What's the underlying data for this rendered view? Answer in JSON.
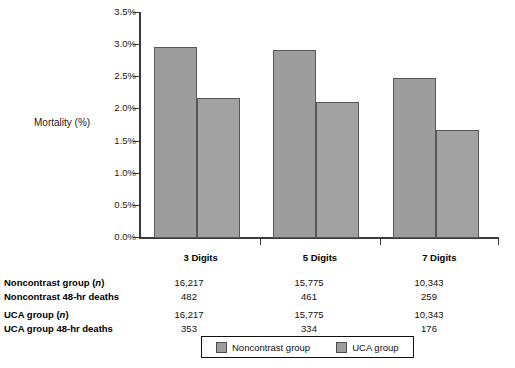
{
  "chart_data": {
    "type": "bar",
    "title": "",
    "xlabel": "",
    "ylabel": "Mortality (%)",
    "categories": [
      "3 Digits",
      "5 Digits",
      "7 Digits"
    ],
    "series": [
      {
        "name": "Noncontrast group",
        "values": [
          2.97,
          2.92,
          2.49
        ],
        "color": "#9d9d9d"
      },
      {
        "name": "UCA group",
        "values": [
          2.18,
          2.12,
          1.68
        ],
        "color": "#a2a2a2"
      }
    ],
    "ylim": [
      0.0,
      3.5
    ],
    "ytick_labels": [
      "0.0%",
      "0.5%",
      "1.0%",
      "1.5%",
      "2.0%",
      "2.5%",
      "3.0%",
      "3.5%"
    ],
    "ytick_values": [
      0.0,
      0.5,
      1.0,
      1.5,
      2.0,
      2.5,
      3.0,
      3.5
    ],
    "grid": false,
    "legend_position": "bottom",
    "table": {
      "column_headers": [
        "3 Digits",
        "5 Digits",
        "7 Digits"
      ],
      "rows": [
        {
          "label": "Noncontrast group (",
          "label_italic": "n",
          "label_end": ")",
          "values": [
            "16,217",
            "15,775",
            "10,343"
          ]
        },
        {
          "label": "Noncontrast 48-hr deaths",
          "label_italic": "",
          "label_end": "",
          "values": [
            "482",
            "461",
            "259"
          ]
        },
        {
          "label": "UCA group (",
          "label_italic": "n",
          "label_end": ")",
          "values": [
            "16,217",
            "15,775",
            "10,343"
          ]
        },
        {
          "label": "UCA group 48-hr deaths",
          "label_italic": "",
          "label_end": "",
          "values": [
            "353",
            "334",
            "176"
          ]
        }
      ]
    }
  },
  "axis": {
    "y_title": "Mortality (%)",
    "ticks": [
      "3.5%",
      "3.0%",
      "2.5%",
      "2.0%",
      "1.5%",
      "1.0%",
      "0.5%",
      "0.0%"
    ]
  },
  "categories": [
    "3 Digits",
    "5 Digits",
    "7 Digits"
  ],
  "legend": {
    "items": [
      {
        "label": "Noncontrast group",
        "color": "#9d9d9d"
      },
      {
        "label": "UCA group",
        "color": "#a2a2a2"
      }
    ]
  },
  "table_rows": [
    {
      "label_a": "Noncontrast group (",
      "label_i": "n",
      "label_b": ")",
      "v0": "16,217",
      "v1": "15,775",
      "v2": "10,343"
    },
    {
      "label_a": "Noncontrast 48-hr deaths",
      "label_i": "",
      "label_b": "",
      "v0": "482",
      "v1": "461",
      "v2": "259"
    },
    {
      "label_a": "UCA group (",
      "label_i": "n",
      "label_b": ")",
      "v0": "16,217",
      "v1": "15,775",
      "v2": "10,343"
    },
    {
      "label_a": "UCA group 48-hr deaths",
      "label_i": "",
      "label_b": "",
      "v0": "353",
      "v1": "334",
      "v2": "176"
    }
  ]
}
